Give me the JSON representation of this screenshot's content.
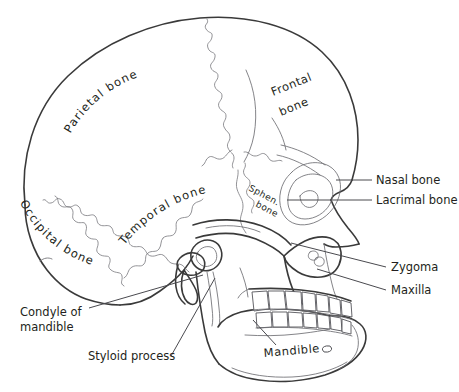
{
  "figure": {
    "background_color": "#ffffff",
    "line_color": "#3a3a3a",
    "suture_color": "#77777c",
    "text_color": "#231f20"
  },
  "labels": {
    "parietal": {
      "text": "Parietal bone",
      "style": "curved-along-arc"
    },
    "frontal_line1": {
      "text": "Frontal"
    },
    "frontal_line2": {
      "text": "bone"
    },
    "occipital": {
      "text": "Occipital bone",
      "style": "curved-along-arc"
    },
    "temporal": {
      "text": "Temporal bone",
      "style": "curved-along-arc"
    },
    "sphenoid_line1": {
      "text": "Sphen."
    },
    "sphenoid_line2": {
      "text": "bone"
    },
    "nasal": {
      "text": "Nasal bone"
    },
    "lacrimal": {
      "text": "Lacrimal bone"
    },
    "zygoma": {
      "text": "Zygoma"
    },
    "maxilla": {
      "text": "Maxilla"
    },
    "mandible": {
      "text": "Mandible"
    },
    "condyle_line1": {
      "text": "Condyle of"
    },
    "condyle_line2": {
      "text": "mandible"
    },
    "styloid": {
      "text": "Styloid process"
    }
  },
  "curved_label_chars": {
    "parietal": [
      "P",
      "a",
      "r",
      "i",
      "e",
      "t",
      "a",
      "l",
      " ",
      "b",
      "o",
      "n",
      "e"
    ],
    "occipital": [
      "O",
      "c",
      "c",
      "i",
      "p",
      "i",
      "t",
      "a",
      "l",
      " ",
      "b",
      "o",
      "n",
      "e"
    ],
    "temporal": [
      "T",
      "e",
      "m",
      "p",
      "o",
      "r",
      "a",
      "l",
      " ",
      "b",
      "o",
      "n",
      "e"
    ]
  }
}
